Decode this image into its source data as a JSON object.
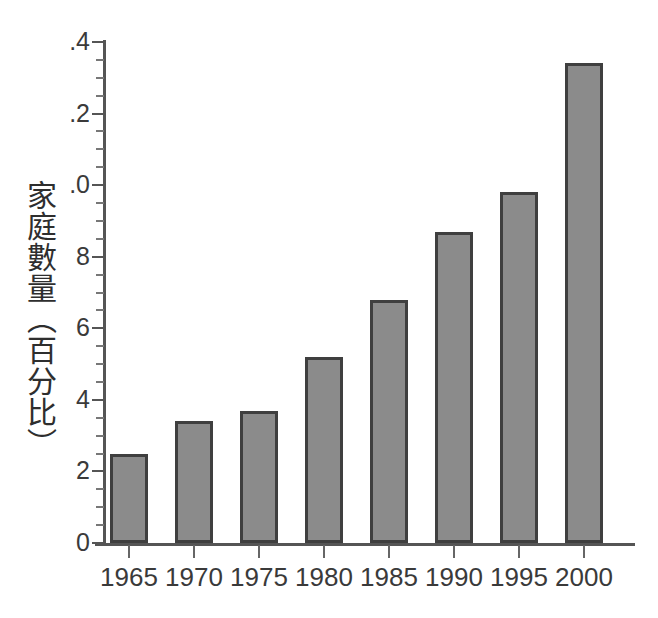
{
  "chart_data": {
    "type": "bar",
    "title": "",
    "subtitle": "",
    "xlabel": "",
    "ylabel": "家庭數量（百分比）",
    "categories": [
      "1965",
      "1970",
      "1975",
      "1980",
      "1985",
      "1990",
      "1995",
      "2000"
    ],
    "values": [
      2.5,
      3.4,
      3.7,
      5.2,
      6.8,
      8.7,
      9.8,
      13.4
    ],
    "ylim": [
      0,
      14
    ],
    "y_major_ticks": [
      0,
      2,
      4,
      6,
      8,
      10,
      12,
      14
    ],
    "y_tick_labels": [
      "0",
      "2",
      "4",
      "6",
      "8",
      ".0",
      ".2",
      ".4"
    ],
    "y_minor_tick_step": 0.5,
    "grid": false,
    "legend": false,
    "legend_position": "none",
    "bar_fill_color": "#8b8b8b",
    "bar_border_color": "#3f3f3f",
    "axis_color": "#555555",
    "text_color": "#3a3a3a",
    "background_color": "#ffffff"
  },
  "axis": {
    "y_title": "家庭數量（百分比）"
  }
}
